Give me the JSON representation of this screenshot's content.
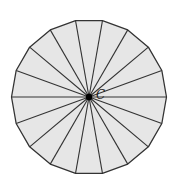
{
  "diagram": {
    "type": "regular-polygon-sectors",
    "sides": 18,
    "center": {
      "x": 89,
      "y": 97,
      "label": "C"
    },
    "radius": 77.5,
    "start_angle_deg": 0,
    "colors": {
      "fill": "#e6e6e6",
      "stroke": "#333333",
      "center_dot": "#000000",
      "background": "#ffffff"
    }
  }
}
